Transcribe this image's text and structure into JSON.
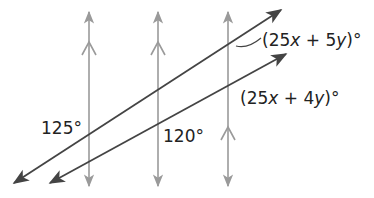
{
  "figure": {
    "type": "parallel-lines-transversals",
    "colors": {
      "background": "#ffffff",
      "vertical_lines": "#9a9a9a",
      "transversals": "#444444",
      "text": "#222222"
    },
    "vertical_lines": [
      {
        "id": "line-1",
        "x": 89,
        "marker": "chevron-upper"
      },
      {
        "id": "line-2",
        "x": 158,
        "marker": "chevron-upper"
      },
      {
        "id": "line-3",
        "x": 228,
        "marker": "chevron-lower"
      }
    ],
    "transversals": [
      {
        "id": "transversal-upper",
        "from": [
          12,
          184
        ],
        "to": [
          282,
          9
        ]
      },
      {
        "id": "transversal-lower",
        "from": [
          48,
          184
        ],
        "to": [
          287,
          53
        ]
      }
    ],
    "angle_labels": [
      {
        "id": "angle-125",
        "text": "125°"
      },
      {
        "id": "angle-120",
        "text": "120°"
      },
      {
        "id": "angle-5y",
        "prefix": "(25",
        "var1": "x",
        "mid": " + 5",
        "var2": "y",
        "suffix": ")°"
      },
      {
        "id": "angle-4y",
        "prefix": "(25",
        "var1": "x",
        "mid": " + 4",
        "var2": "y",
        "suffix": ")°"
      }
    ]
  }
}
